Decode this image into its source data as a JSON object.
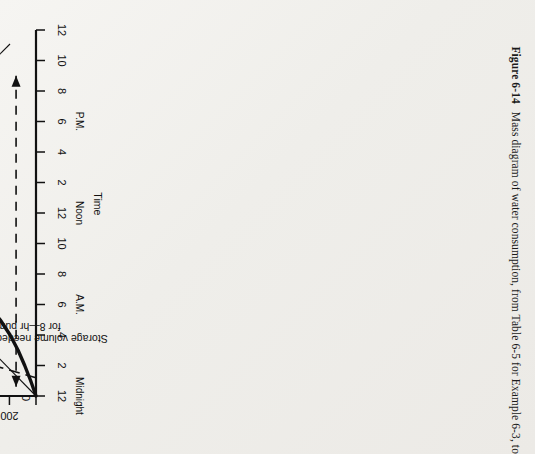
{
  "figure": {
    "number": "Figure 6-14",
    "caption": "Mass diagram of water consumption, from Table 6-5 for Example 6-3, to"
  },
  "chart_data": {
    "type": "line",
    "title": "",
    "xlabel": "Time",
    "ylabel": "Cumulative consumption, thousands of gallons",
    "xlim": [
      0,
      24
    ],
    "ylim": [
      0,
      2800
    ],
    "grid": false,
    "legend": "none",
    "x_ticks": [
      0,
      2,
      4,
      6,
      8,
      10,
      12,
      14,
      16,
      18,
      20,
      22,
      24
    ],
    "x_tick_labels": [
      "12",
      "2",
      "4",
      "6",
      "8",
      "10",
      "12",
      "2",
      "4",
      "6",
      "8",
      "10",
      "12"
    ],
    "x_tick_sublabels": [
      "Midnight",
      "",
      "",
      "A.M.",
      "",
      "",
      "Noon",
      "",
      "",
      "P.M.",
      "",
      "",
      ""
    ],
    "y_ticks": [
      0,
      200,
      400,
      600,
      800,
      1000,
      1200,
      1400,
      1600,
      1800,
      2000,
      2200,
      2400,
      2600,
      2800
    ],
    "y_tick_labels": [
      "0",
      "200",
      "400",
      "600",
      "800",
      "1000",
      "1200",
      "1400",
      "1600",
      "1800",
      "2000",
      "2200",
      "2400",
      "2600",
      "2800"
    ],
    "series": [
      {
        "name": "Accumulated demand line",
        "style": "thick-solid",
        "x": [
          0,
          1,
          2,
          3,
          4,
          5,
          6,
          7,
          8,
          9,
          10,
          11,
          12,
          13,
          14,
          15,
          16,
          17,
          18,
          19,
          20,
          21,
          22,
          23,
          24
        ],
        "y": [
          0,
          40,
          85,
          135,
          195,
          270,
          370,
          480,
          600,
          740,
          880,
          1020,
          1170,
          1320,
          1470,
          1620,
          1770,
          1910,
          2050,
          2180,
          2300,
          2420,
          2530,
          2630,
          2700
        ]
      },
      {
        "name": "Average 24-hr pumping rate = 1860 gpm",
        "style": "thin-solid",
        "x": [
          0,
          24
        ],
        "y": [
          0,
          2700
        ]
      },
      {
        "name": "Average 8-hr pumping rate = 5580 gpm",
        "style": "long-dash",
        "x": [
          1.2,
          8
        ],
        "y": [
          0,
          2700
        ]
      }
    ],
    "construction_lines": [
      {
        "name": "reservoir-capacity-level",
        "orientation": "horizontal",
        "y": 2700,
        "from_x": 0,
        "to_x": 8
      },
      {
        "name": "eight-hour-start-marker",
        "orientation": "vertical",
        "x": 8,
        "from_y": 600,
        "to_y": 2700
      },
      {
        "name": "six-hundred-level",
        "orientation": "horizontal",
        "y": 600,
        "from_x": 8,
        "to_x": 24
      }
    ],
    "annotations": [
      {
        "name": "reservoir-empty",
        "text": "Reservoir empty",
        "x": 1.6,
        "y": 2150
      },
      {
        "name": "reservoir-full",
        "text": "Reservoir full",
        "x": 20.1,
        "y": 460
      },
      {
        "name": "accumulated-demand-line",
        "text": "Accumulated\ndemand line",
        "x": 17.6,
        "y": 930
      },
      {
        "name": "storage-volume-24hr",
        "text": "Storage volume\nneeded is\n500,000 gal for\n24—hr pumping",
        "x": 12.4,
        "y": 1980
      },
      {
        "name": "avg-24hr-rate",
        "text": "Average 24-hr pumping rate = 1860 gpm",
        "x": 11.0,
        "y": 1150
      },
      {
        "name": "avg-8hr-rate",
        "text": "Average 8-hr pumping rate = 5580 gpm",
        "x": 4.4,
        "y": 1400
      },
      {
        "name": "storage-volume-8hr",
        "text": "Storage volume needed is 2.11 mil gal\nfor 8—hr pumping",
        "x": 4.0,
        "y": 130
      }
    ],
    "annotation_lines": {
      "storage_24hr_label": "Storage volume",
      "storage_24hr_label2": "needed is",
      "storage_24hr_label3": "500,000 gal for",
      "storage_24hr_label4": "24—hr pumping",
      "accumulated_1": "Accumulated",
      "accumulated_2": "demand line",
      "storage_8hr_1": "Storage volume needed is 2.11 mil gal",
      "storage_8hr_2": "for 8—hr pumping"
    }
  },
  "colors": {
    "ink": "#111111",
    "paper": "#f3f2ef"
  }
}
